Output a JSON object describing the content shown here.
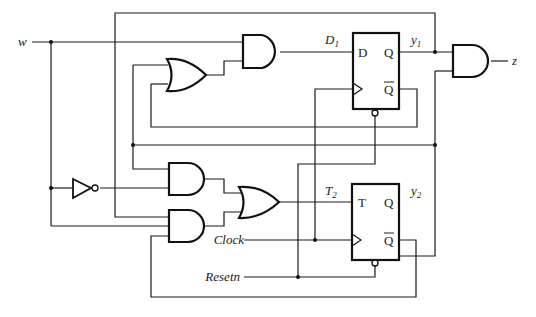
{
  "diagram": {
    "inputs": {
      "w": "w",
      "clock": "Clock",
      "resetn": "Resetn"
    },
    "output": {
      "z": "z"
    },
    "signals": {
      "d1_main": "D",
      "d1_sub": "1",
      "t2_main": "T",
      "t2_sub": "2",
      "y1_main": "y",
      "y1_sub": "1",
      "y2_main": "y",
      "y2_sub": "2"
    },
    "flipflops": [
      {
        "type": "D flip-flop",
        "input_label": "D",
        "q_label": "Q",
        "qbar_label": "Q"
      },
      {
        "type": "T flip-flop",
        "input_label": "T",
        "q_label": "Q",
        "qbar_label": "Q"
      }
    ],
    "gates": [
      "AND (D1)",
      "OR (D1 feedback)",
      "NOT (w)",
      "AND (upper T2)",
      "AND (lower T2)",
      "OR (T2)",
      "AND (z)"
    ],
    "colors": {
      "line": "#111111",
      "background": "#ffffff"
    }
  }
}
